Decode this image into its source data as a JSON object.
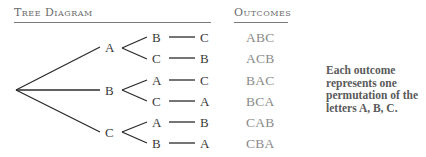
{
  "tree_header": "Tree Diagram",
  "outcomes_header": "Outcomes",
  "tree": {
    "level1": [
      "A",
      "B",
      "C"
    ],
    "level2": [
      "B",
      "C",
      "A",
      "C",
      "A",
      "B"
    ],
    "level3": [
      "C",
      "B",
      "C",
      "A",
      "B",
      "A"
    ]
  },
  "outcomes": [
    "ABC",
    "ACB",
    "BAC",
    "BCA",
    "CAB",
    "CBA"
  ],
  "note": "Each outcome represents one permutation of the letters A, B, C.",
  "colors": {
    "line": "#2b2b2b",
    "outcome_text": "#8a8a8a",
    "header_text": "#6b6b6b"
  }
}
